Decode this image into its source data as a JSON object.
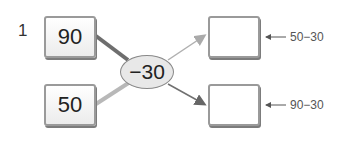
{
  "problem": {
    "number": "1",
    "inputs": [
      {
        "value": "90"
      },
      {
        "value": "50"
      }
    ],
    "operator": "−30",
    "outputs": [
      {
        "value": "",
        "hint": "50−30"
      },
      {
        "value": "",
        "hint": "90−30"
      }
    ]
  }
}
